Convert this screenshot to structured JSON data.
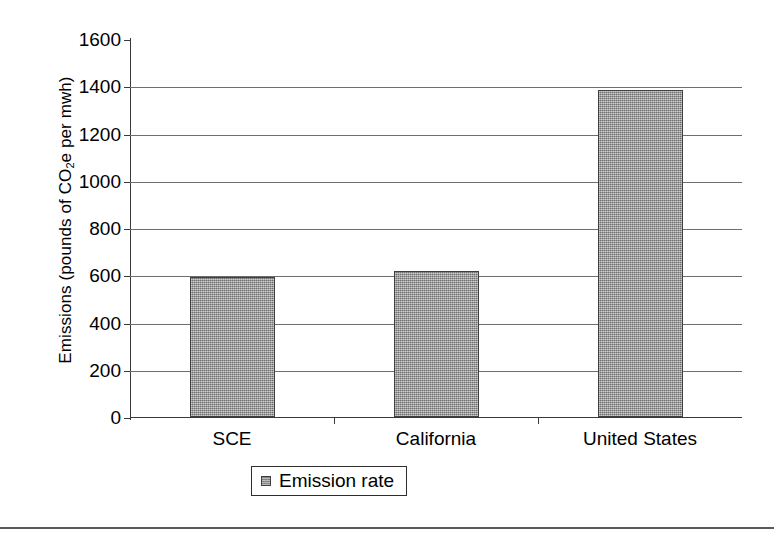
{
  "chart_data": {
    "type": "bar",
    "title": "",
    "xlabel": "",
    "ylabel_parts": {
      "before": "Emissions (pounds of CO",
      "sub": "2",
      "after": "e per mwh)"
    },
    "ylabel": "Emissions (pounds of CO2e per mwh)",
    "categories": [
      "SCE",
      "California",
      "United States"
    ],
    "values": [
      592,
      620,
      1385
    ],
    "series": [
      {
        "name": "Emission rate",
        "values": [
          592,
          620,
          1385
        ]
      }
    ],
    "ylim": [
      0,
      1600
    ],
    "ytick_labels": [
      "0",
      "200",
      "400",
      "600",
      "800",
      "1000",
      "1200",
      "1400",
      "1600"
    ],
    "ytick_values": [
      0,
      200,
      400,
      600,
      800,
      1000,
      1200,
      1400,
      1600
    ],
    "grid": "horizontal",
    "legend": {
      "position": "bottom-center",
      "entries": [
        "Emission rate"
      ]
    },
    "colors": {
      "bar_fill": "#9d9d9d",
      "bar_edge": "#3f3f3f",
      "gridline": "#6e6e6e",
      "axis": "#3a3a3a",
      "background": "#ffffff",
      "text": "#000000"
    }
  }
}
